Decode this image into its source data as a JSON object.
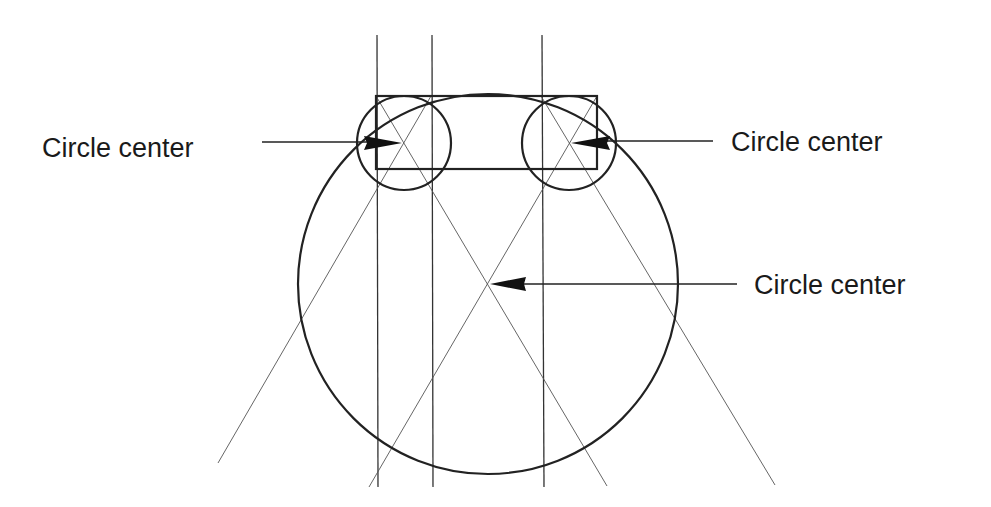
{
  "diagram": {
    "labels": {
      "left": "Circle center",
      "right": "Circle center",
      "center": "Circle center"
    },
    "colors": {
      "background": "#ffffff",
      "stroke": "#222222",
      "construction": "#555555"
    },
    "geometry": {
      "rectangle": {
        "x1": 376,
        "y1": 96,
        "x2": 597,
        "y2": 169
      },
      "large_circle": {
        "cx": 488,
        "cy": 285,
        "r": 190
      },
      "small_circles": [
        {
          "cx": 404,
          "cy": 143,
          "r": 47
        },
        {
          "cx": 569,
          "cy": 143,
          "r": 47
        }
      ],
      "vertical_lines_x": [
        377,
        432,
        543
      ]
    }
  }
}
